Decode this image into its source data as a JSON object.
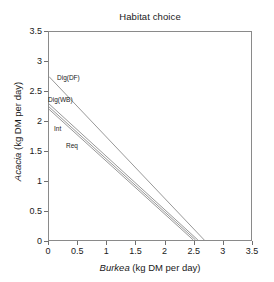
{
  "chart_data": {
    "type": "line",
    "title": "Habitat choice",
    "xlabel_italic": "Burkea",
    "xlabel_rest": " (kg DM per day)",
    "ylabel_italic": "Acacia",
    "ylabel_rest": " (kg DM per day)",
    "xlim": [
      0,
      3.5
    ],
    "ylim": [
      0,
      3.5
    ],
    "xticks": [
      0,
      0.5,
      1,
      1.5,
      2,
      2.5,
      3,
      3.5
    ],
    "xtick_labels": [
      "0",
      "0.5",
      "1",
      "1.5",
      "2",
      "2.5",
      "3",
      "3.5"
    ],
    "yticks": [
      0,
      0.5,
      1,
      1.5,
      2,
      2.5,
      3,
      3.5
    ],
    "ytick_labels": [
      "0",
      "0.5",
      "1",
      "1.5",
      "2",
      "2.5",
      "3",
      "3.5"
    ],
    "grid": false,
    "legend": "none (inline series annotations)",
    "line_color": "#8c8c8c",
    "frame_color": "#8a8a8a",
    "series": [
      {
        "name": "Dig(DF)",
        "label": "Dig(DF)",
        "x": [
          0,
          2.69
        ],
        "y": [
          2.75,
          0
        ],
        "intercept": 2.75,
        "xintercept": 2.69,
        "label_x_px": 57,
        "label_y_px": 74
      },
      {
        "name": "Dig(WB)",
        "label": "Dig(WB)",
        "x": [
          0,
          2.58
        ],
        "y": [
          2.29,
          0
        ],
        "intercept": 2.29,
        "xintercept": 2.58,
        "label_x_px": 48,
        "label_y_px": 96
      },
      {
        "name": "Int",
        "label": "Int",
        "x": [
          0,
          2.54
        ],
        "y": [
          2.24,
          0
        ],
        "intercept": 2.24,
        "xintercept": 2.54,
        "label_x_px": 54,
        "label_y_px": 125
      },
      {
        "name": "Req",
        "label": "Req",
        "x": [
          0,
          2.5
        ],
        "y": [
          2.2,
          0
        ],
        "intercept": 2.2,
        "xintercept": 2.5,
        "label_x_px": 66,
        "label_y_px": 142
      }
    ]
  }
}
